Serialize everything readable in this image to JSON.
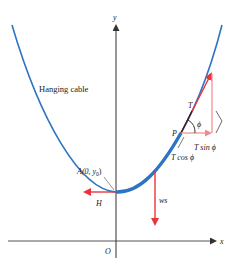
{
  "figure": {
    "title_label": "Hanging cable",
    "axes": {
      "x_label": "x",
      "y_label": "y",
      "origin_label": "O"
    },
    "points": {
      "A": {
        "label": "A(0, y",
        "sub": "0",
        "close": ")"
      },
      "P": {
        "label": "P"
      },
      "T": {
        "label": "T"
      }
    },
    "forces": {
      "H": "H",
      "ws": "ws",
      "T_sin": "T sin ϕ",
      "T_cos": "T cos ϕ",
      "phi": "ϕ"
    },
    "colors": {
      "cable": "#2e74c4",
      "force": "#e8353a",
      "force_light": "#f08a8d",
      "axis": "#333333",
      "text": "#222222"
    }
  }
}
